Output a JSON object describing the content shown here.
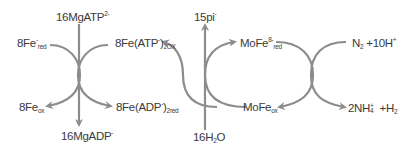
{
  "diagram": {
    "colors": {
      "arrow": "#8c8c8c",
      "text": "#3a3a3a",
      "background": "#ffffff"
    },
    "labels": {
      "fe_red": {
        "base": "8Fe",
        "sup": "-",
        "sub": "red"
      },
      "mgatp": {
        "base": "16MgATP",
        "sup": "2-"
      },
      "fe_atp_ox": {
        "base": "8Fe(ATP",
        "sup": "-",
        "close": ")",
        "sub": "2OX"
      },
      "pi": {
        "base": "15pi",
        "sup": "-"
      },
      "mofe_red": {
        "base": "MoFe",
        "sup": "8-",
        "sub": "red"
      },
      "n2_h": {
        "n": "N",
        "n_sub": "2",
        "rest": " +10H",
        "sup": "+"
      },
      "fe_ox": {
        "base": "8Fe",
        "sub": "ox"
      },
      "mgadp": {
        "base": "16MgADP",
        "sup": "-"
      },
      "fe_adp_red": {
        "base": "8Fe(ADP",
        "sup": "-",
        "close": ")",
        "sub": "2red"
      },
      "h2o": {
        "pre": "16H",
        "sub": "2",
        "post": "O"
      },
      "mofe_ox": {
        "base": "MoFe",
        "sub": "ox"
      },
      "nh4_h2": {
        "pre": "2NH",
        "sup": "+",
        "sub": "4",
        "mid": " +H",
        "sub2": "2"
      }
    }
  }
}
